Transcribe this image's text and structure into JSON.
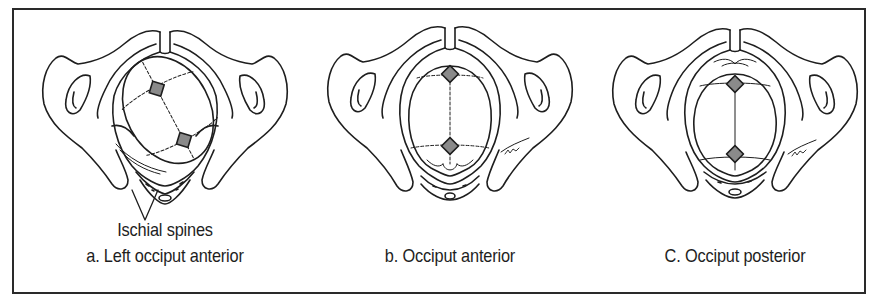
{
  "figure": {
    "panels": [
      {
        "id": "a",
        "annotation": "Ischial spines",
        "caption": "a. Left occiput anterior",
        "orientation": "left-occiput-anterior"
      },
      {
        "id": "b",
        "annotation": "",
        "caption": "b. Occiput anterior",
        "orientation": "occiput-anterior"
      },
      {
        "id": "c",
        "annotation": "",
        "caption": "C. Occiput posterior",
        "orientation": "occiput-posterior"
      }
    ],
    "colors": {
      "line": "#1e1e1e",
      "fontanelle_fill": "#8a8a8a",
      "background": "#ffffff",
      "border": "#2a2a2a"
    }
  }
}
